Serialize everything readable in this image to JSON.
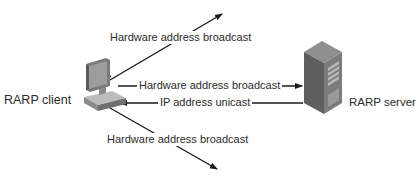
{
  "diagram": {
    "nodes": {
      "client": {
        "label": "RARP client",
        "icon": "desktop-computer-icon"
      },
      "server": {
        "label": "RARP server",
        "icon": "tower-server-icon"
      }
    },
    "edges": {
      "broadcast_up": {
        "label": "Hardware address broadcast",
        "direction": "client-to-network"
      },
      "broadcast_server": {
        "label": "Hardware address broadcast",
        "direction": "client-to-server"
      },
      "unicast_reply": {
        "label": "IP address unicast",
        "direction": "server-to-client"
      },
      "broadcast_down": {
        "label": "Hardware address broadcast",
        "direction": "client-to-network"
      }
    },
    "colors": {
      "line": "#1a1a1a",
      "text": "#2b2b2b",
      "device_dark": "#6e6e6e",
      "device_light": "#a9a9a9"
    }
  }
}
